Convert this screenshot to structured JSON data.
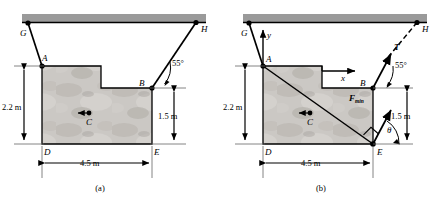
{
  "figure": {
    "panels": [
      {
        "id": "a",
        "caption": "(a)",
        "points": [
          {
            "name": "G",
            "label": "G",
            "x": 28,
            "y": 23
          },
          {
            "name": "H",
            "label": "H",
            "x": 196,
            "y": 22
          },
          {
            "name": "A",
            "label": "A",
            "x": 42,
            "y": 66
          },
          {
            "name": "B",
            "label": "B",
            "x": 152,
            "y": 88
          },
          {
            "name": "C",
            "label": "C",
            "x": 89,
            "y": 118
          },
          {
            "name": "D",
            "label": "D",
            "x": 42,
            "y": 144
          },
          {
            "name": "E",
            "label": "E",
            "x": 152,
            "y": 144
          }
        ],
        "dimensions": [
          {
            "name": "height-left",
            "label": "2.2 m",
            "value": 2.2,
            "unit": "m"
          },
          {
            "name": "height-right",
            "label": "1.5 m",
            "value": 1.5,
            "unit": "m"
          },
          {
            "name": "width-bottom",
            "label": "4.5 m",
            "value": 4.5,
            "unit": "m"
          }
        ],
        "angles": [
          {
            "name": "cable-BH-angle",
            "label": "55°",
            "value": 55,
            "unit": "deg"
          }
        ]
      },
      {
        "id": "b",
        "caption": "(b)",
        "points": [
          {
            "name": "G",
            "label": "G",
            "x": 28,
            "y": 23
          },
          {
            "name": "H",
            "label": "H",
            "x": 196,
            "y": 22
          },
          {
            "name": "A",
            "label": "A",
            "x": 42,
            "y": 66
          },
          {
            "name": "B",
            "label": "B",
            "x": 152,
            "y": 88
          },
          {
            "name": "C",
            "label": "C",
            "x": 89,
            "y": 118
          },
          {
            "name": "D",
            "label": "D",
            "x": 42,
            "y": 144
          },
          {
            "name": "E",
            "label": "E",
            "x": 152,
            "y": 144
          }
        ],
        "axes": [
          {
            "name": "y-axis",
            "label": "y"
          },
          {
            "name": "x-axis",
            "label": "x"
          }
        ],
        "forces": [
          {
            "name": "tension-force",
            "label": "T",
            "description": "cable tension along BH"
          },
          {
            "name": "minimum-force",
            "label": "F",
            "sublabel": "min",
            "description": "minimum force at E perpendicular to AE"
          }
        ],
        "dimensions": [
          {
            "name": "height-left",
            "label": "2.2 m",
            "value": 2.2,
            "unit": "m"
          },
          {
            "name": "height-right",
            "label": "1.5 m",
            "value": 1.5,
            "unit": "m"
          },
          {
            "name": "width-bottom",
            "label": "4.5 m",
            "value": 4.5,
            "unit": "m"
          }
        ],
        "angles": [
          {
            "name": "cable-BH-angle",
            "label": "55°",
            "value": 55,
            "unit": "deg"
          },
          {
            "name": "theta-angle",
            "label": "θ",
            "value": null,
            "unit": "deg"
          }
        ]
      }
    ],
    "colors": {
      "ceiling_fill": "#9a9a9a",
      "line": "#000000",
      "block_fill": "#c9c6c2",
      "thin_line": "#555555"
    }
  }
}
